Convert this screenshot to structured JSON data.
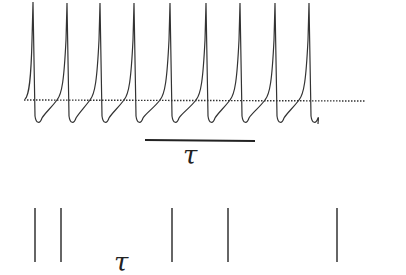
{
  "figure": {
    "top_panel": {
      "description": "periodic spike train with after-hyperpolarization",
      "spike_count": 9,
      "spike_x": [
        33,
        67,
        100,
        134,
        170,
        206,
        240,
        275,
        309
      ],
      "baseline_y": 100,
      "threshold_line": {
        "style": "dotted",
        "x1": 24,
        "x2": 365,
        "y": 100
      },
      "scale_bar": {
        "x1": 145,
        "x2": 255,
        "y": 140,
        "label": "τ"
      }
    },
    "bottom_panel": {
      "description": "spike raster (vertical tick marks)",
      "spike_x": [
        35,
        61,
        172,
        228,
        337
      ],
      "label": "τ"
    },
    "colors": {
      "trace": "#333333",
      "background": "#ffffff"
    }
  }
}
